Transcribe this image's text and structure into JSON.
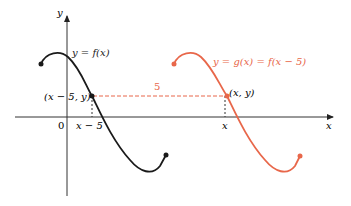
{
  "colors": {
    "f_curve": "#1a1a1a",
    "g_curve": "#e8674a",
    "axis": "#333333",
    "shift_line": "#e8674a"
  },
  "axes": {
    "x_label": "x",
    "y_label": "y",
    "origin_label": "0"
  },
  "labels": {
    "f_eq": "y = f(x)",
    "g_eq": "y = g(x) = f(x − 5)",
    "point_f": "(x − 5, y)",
    "point_g": "(x, y)",
    "tick_f": "x − 5",
    "tick_g": "x",
    "shift": "5"
  }
}
